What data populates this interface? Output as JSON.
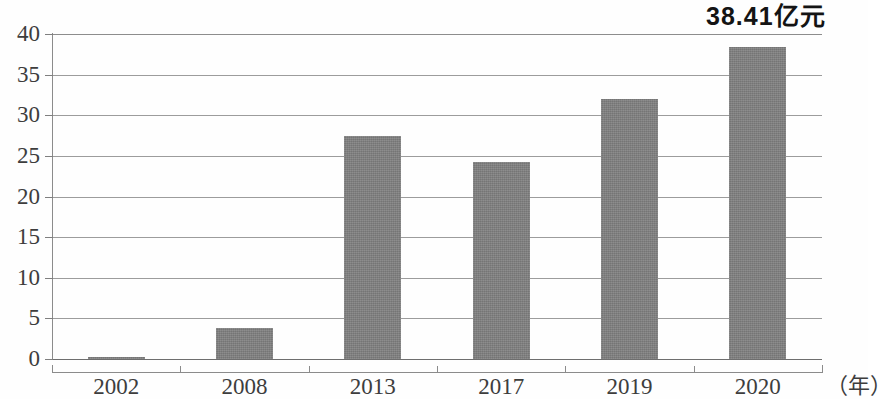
{
  "chart_data": {
    "type": "bar",
    "title": "",
    "subtitle": "",
    "xlabel": "（年）",
    "ylabel": "",
    "categories": [
      "2002",
      "2008",
      "2013",
      "2017",
      "2019",
      "2020"
    ],
    "values": [
      0.3,
      3.8,
      27.4,
      24.2,
      32.0,
      38.41
    ],
    "ylim": [
      0,
      40
    ],
    "y_ticks": [
      "0",
      "5",
      "10",
      "15",
      "20",
      "25",
      "30",
      "35",
      "40"
    ],
    "y_tick_values": [
      0,
      5,
      10,
      15,
      20,
      25,
      30,
      35,
      40
    ],
    "grid": true,
    "legend": null,
    "annotations": [
      {
        "text": "38.41亿元",
        "target_category": "2020",
        "target_value": 38.41
      }
    ],
    "series_color": "#808080"
  },
  "chart": {
    "annotation_label": "38.41亿元",
    "x_axis_unit": "（年）"
  }
}
